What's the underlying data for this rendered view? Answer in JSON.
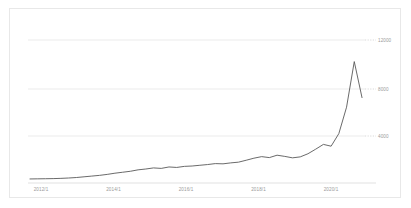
{
  "card": {
    "background": "#ffffff",
    "border_color": "#e8e8e8"
  },
  "chart_data": {
    "type": "line",
    "title": "",
    "subtitle": "",
    "xlabel": "",
    "ylabel": "",
    "grid": true,
    "legend": false,
    "legend_position": "none",
    "line_color": "#595959",
    "grid_color": "#e6e6e6",
    "ylim": [
      0,
      13500
    ],
    "yticks": [
      4000,
      8000,
      12000
    ],
    "ytick_labels": [
      "4000",
      "8000",
      "12000"
    ],
    "xlim": [
      "2011/1",
      "2021/10"
    ],
    "xticks": [
      "2012/1",
      "2014/1",
      "2016/1",
      "2018/1",
      "2020/1"
    ],
    "xtick_labels": [
      "2012/1",
      "2014/1",
      "2016/1",
      "2018/1",
      "2020/1"
    ],
    "x": [
      "2011/1",
      "2011/4",
      "2011/7",
      "2011/10",
      "2012/1",
      "2012/4",
      "2012/7",
      "2012/10",
      "2013/1",
      "2013/4",
      "2013/7",
      "2013/10",
      "2014/1",
      "2014/4",
      "2014/7",
      "2014/10",
      "2015/1",
      "2015/4",
      "2015/7",
      "2015/10",
      "2016/1",
      "2016/4",
      "2016/7",
      "2016/10",
      "2017/1",
      "2017/4",
      "2017/7",
      "2017/10",
      "2018/1",
      "2018/4",
      "2018/7",
      "2018/10",
      "2019/1",
      "2019/4",
      "2019/7",
      "2019/10",
      "2020/1",
      "2020/4",
      "2020/7",
      "2020/10",
      "2021/1",
      "2021/4",
      "2021/7",
      "2021/10"
    ],
    "values": [
      420,
      430,
      440,
      450,
      470,
      500,
      540,
      600,
      660,
      720,
      800,
      900,
      980,
      1060,
      1180,
      1250,
      1340,
      1300,
      1420,
      1380,
      1470,
      1500,
      1560,
      1620,
      1700,
      1680,
      1760,
      1820,
      1980,
      2150,
      2280,
      2200,
      2400,
      2300,
      2180,
      2260,
      2520,
      2900,
      3300,
      3150,
      4200,
      6400,
      10200,
      7200
    ],
    "series": [
      {
        "name": "",
        "values": [
          420,
          430,
          440,
          450,
          470,
          500,
          540,
          600,
          660,
          720,
          800,
          900,
          980,
          1060,
          1180,
          1250,
          1340,
          1300,
          1420,
          1380,
          1470,
          1500,
          1560,
          1620,
          1700,
          1680,
          1760,
          1820,
          1980,
          2150,
          2280,
          2200,
          2400,
          2300,
          2180,
          2260,
          2520,
          2900,
          3300,
          3150,
          4200,
          6400,
          10200,
          7200
        ]
      }
    ],
    "annotations": [],
    "peak": {
      "x": "2021/8",
      "value": 10200
    },
    "last": {
      "x": "2021/10",
      "value": 7200
    }
  }
}
